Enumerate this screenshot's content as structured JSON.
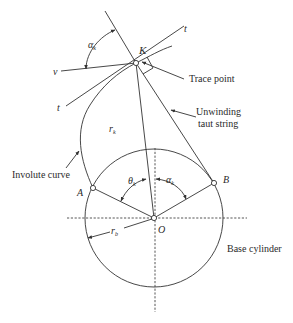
{
  "diagram": {
    "labels": {
      "trace_point": "Trace point",
      "unwinding_1": "Unwinding",
      "unwinding_2": "taut string",
      "involute_curve": "Involute curve",
      "base_cylinder": "Base cylinder"
    },
    "symbols": {
      "K": "K",
      "t_top": "t",
      "t_left": "t",
      "v": "v",
      "alpha_k_top": "α",
      "alpha_k_top_sub": "k",
      "r_k": "r",
      "r_k_sub": "k",
      "A": "A",
      "B": "B",
      "O": "O",
      "theta_k": "θ",
      "theta_k_sub": "k",
      "alpha_k": "α",
      "alpha_k_sub": "k",
      "r_b": "r",
      "r_b_sub": "b"
    },
    "points": {
      "O": [
        154,
        218
      ],
      "K": [
        136,
        63
      ],
      "A": [
        93,
        188
      ],
      "B": [
        214,
        183
      ]
    },
    "base_circle_radius": 69,
    "colors": {
      "line": "#333333",
      "text": "#2a2a2a",
      "background": "#ffffff"
    }
  }
}
